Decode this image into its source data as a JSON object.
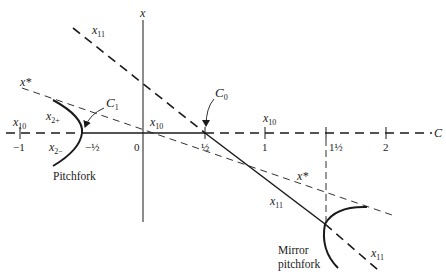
{
  "diagram": {
    "type": "bifurcation-diagram",
    "axes": {
      "horizontal_label": "C",
      "vertical_label": "x",
      "ticks": [
        {
          "value": -1,
          "label": "−1"
        },
        {
          "value": -0.5,
          "label": "−½"
        },
        {
          "value": 0,
          "label": "0"
        },
        {
          "value": 0.5,
          "label": "½"
        },
        {
          "value": 1,
          "label": "1"
        },
        {
          "value": 1.5,
          "label": "1½"
        },
        {
          "value": 2,
          "label": "2"
        }
      ]
    },
    "branch_labels": {
      "x10_left": {
        "base": "x",
        "sub": "10"
      },
      "x10_center": {
        "base": "x",
        "sub": "10"
      },
      "x10_right": {
        "base": "x",
        "sub": "10"
      },
      "x11_top": {
        "base": "x",
        "sub": "11"
      },
      "x11_middle": {
        "base": "x",
        "sub": "11"
      },
      "x11_bottom": {
        "base": "x",
        "sub": "11"
      },
      "x2plus": {
        "base": "x",
        "sub": "2+"
      },
      "x2minus": {
        "base": "x",
        "sub": "2−"
      },
      "xstar_left": "x*",
      "xstar_right": "x*"
    },
    "points": {
      "C0": {
        "base": "C",
        "sub": "0"
      },
      "C1": {
        "base": "C",
        "sub": "1"
      }
    },
    "captions": {
      "pitchfork": "Pitchfork",
      "mirror_line1": "Mirror",
      "mirror_line2": "pitchfork"
    }
  }
}
